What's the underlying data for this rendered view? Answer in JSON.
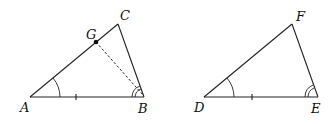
{
  "figure": {
    "triangle_left": {
      "vertices": {
        "A": "A",
        "B": "B",
        "C": "C"
      },
      "point_on_side": {
        "G": "G"
      },
      "markings": {
        "side_AB": "single tick",
        "angle_A": "single arc",
        "angle_B": "double arc",
        "segment_GB": "dashed"
      }
    },
    "triangle_right": {
      "vertices": {
        "D": "D",
        "E": "E",
        "F": "F"
      },
      "markings": {
        "side_DE": "single tick",
        "angle_D": "single arc",
        "angle_E": "double arc"
      }
    }
  }
}
